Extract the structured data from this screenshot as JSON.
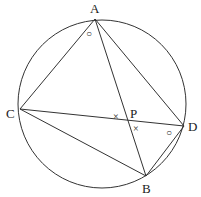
{
  "diagram": {
    "circle": {
      "cx": 102,
      "cy": 104,
      "r": 84
    },
    "points": {
      "A": {
        "label": "A",
        "x": 95,
        "y": 19,
        "lx": 90,
        "ly": 13
      },
      "B": {
        "label": "B",
        "x": 146,
        "y": 176,
        "lx": 142,
        "ly": 192
      },
      "C": {
        "label": "C",
        "x": 20,
        "y": 109,
        "lx": 6,
        "ly": 118
      },
      "D": {
        "label": "D",
        "x": 184,
        "y": 126,
        "lx": 188,
        "ly": 131
      },
      "P": {
        "label": "P",
        "x": 127,
        "y": 120,
        "lx": 130,
        "ly": 117
      }
    },
    "segments": [
      "AC",
      "AD",
      "AB",
      "CD",
      "CB",
      "BD"
    ],
    "angle_marks": [
      {
        "symbol": "○",
        "x": 89,
        "y": 34,
        "meaning": "angle CAB"
      },
      {
        "symbol": "○",
        "x": 168,
        "y": 133,
        "meaning": "angle ADB"
      },
      {
        "symbol": "×",
        "x": 114,
        "y": 117,
        "meaning": "angle CPA"
      },
      {
        "symbol": "×",
        "x": 133,
        "y": 130,
        "meaning": "angle DPB"
      }
    ]
  }
}
